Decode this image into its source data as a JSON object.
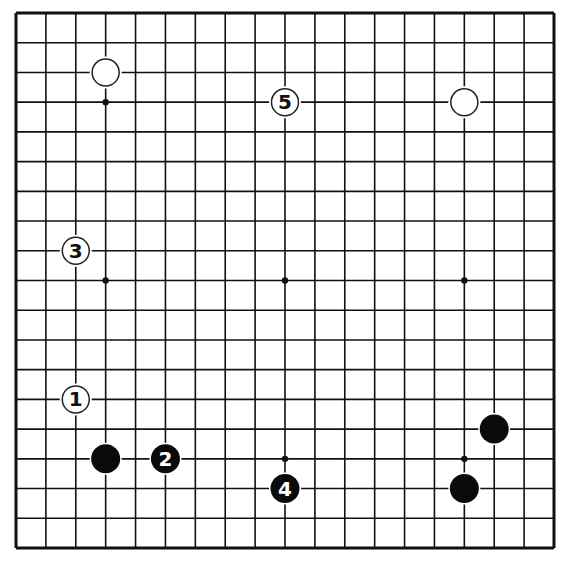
{
  "diagram": {
    "type": "go-board",
    "size": 19,
    "colors": {
      "background": "#ffffff",
      "line": "#111111",
      "black_stone": "#0a0a0a",
      "white_stone": "#ffffff"
    },
    "star_points": [
      [
        3,
        3
      ],
      [
        9,
        3
      ],
      [
        15,
        3
      ],
      [
        3,
        9
      ],
      [
        9,
        9
      ],
      [
        15,
        9
      ],
      [
        3,
        15
      ],
      [
        9,
        15
      ],
      [
        15,
        15
      ]
    ],
    "stones": [
      {
        "color": "white",
        "col": 3,
        "row": 2,
        "label": ""
      },
      {
        "color": "white",
        "col": 15,
        "row": 3,
        "label": ""
      },
      {
        "color": "black",
        "col": 3,
        "row": 15,
        "label": ""
      },
      {
        "color": "black",
        "col": 16,
        "row": 14,
        "label": ""
      },
      {
        "color": "black",
        "col": 15,
        "row": 16,
        "label": ""
      },
      {
        "color": "white",
        "col": 2,
        "row": 13,
        "label": "1"
      },
      {
        "color": "black",
        "col": 5,
        "row": 15,
        "label": "2"
      },
      {
        "color": "white",
        "col": 2,
        "row": 8,
        "label": "3"
      },
      {
        "color": "black",
        "col": 9,
        "row": 16,
        "label": "4"
      },
      {
        "color": "white",
        "col": 9,
        "row": 3,
        "label": "5"
      }
    ]
  }
}
